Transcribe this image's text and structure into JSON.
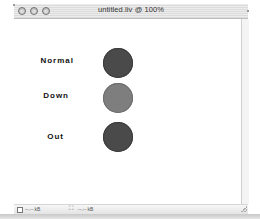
{
  "window": {
    "title": "untitled.liv @ 100%"
  },
  "states": [
    {
      "label": "Normal",
      "color": "#4a4a4a",
      "border": "#3a3a3a"
    },
    {
      "label": "Down",
      "color": "#7e7e7e",
      "border": "#6c6c6c"
    },
    {
      "label": "Out",
      "color": "#4a4a4a",
      "border": "#3a3a3a"
    }
  ],
  "statusbar": {
    "size_left": "--.-- kB",
    "size_right": "--.-- kB"
  }
}
